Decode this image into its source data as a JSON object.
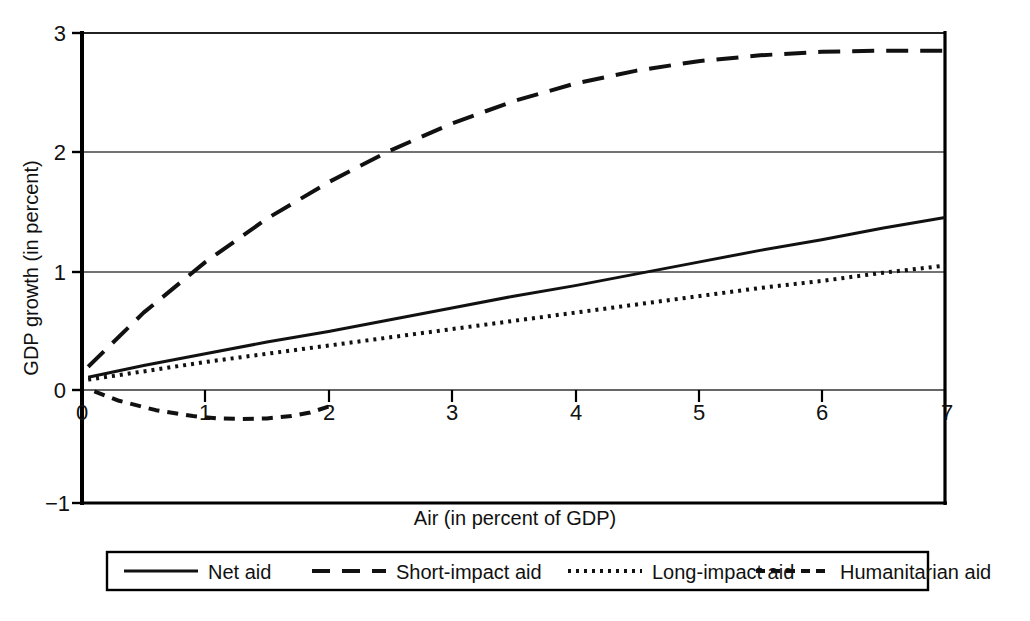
{
  "chart_data": {
    "type": "line",
    "title": "",
    "xlabel": "Air (in percent of GDP)",
    "ylabel": "GDP growth (in percent)",
    "xlim": [
      0,
      7
    ],
    "ylim": [
      -1,
      3
    ],
    "xticks": [
      "0",
      "1",
      "2",
      "3",
      "4",
      "5",
      "6",
      "7"
    ],
    "xtick_values": [
      0,
      1,
      2,
      3,
      4,
      5,
      6,
      7
    ],
    "yticks": [
      "3",
      "2",
      "1",
      "0",
      "−1"
    ],
    "ytick_values": [
      3,
      2,
      1,
      0,
      -1
    ],
    "grid": "horizontal gridlines at y = 3, 2, 1, 0",
    "legend_position": "below plot, single horizontal row in bordered box",
    "series": [
      {
        "name": "Net aid",
        "style": "solid",
        "x": [
          0.05,
          0.5,
          1,
          1.5,
          2,
          2.5,
          3,
          3.5,
          4,
          4.5,
          5,
          5.5,
          6,
          6.5,
          7
        ],
        "values": [
          0.07,
          0.17,
          0.27,
          0.37,
          0.46,
          0.56,
          0.66,
          0.76,
          0.85,
          0.95,
          1.05,
          1.15,
          1.24,
          1.34,
          1.43
        ]
      },
      {
        "name": "Short-impact aid",
        "style": "dashed",
        "x": [
          0.05,
          0.5,
          1,
          1.5,
          2,
          2.5,
          3,
          3.5,
          4,
          4.5,
          5,
          5.5,
          6,
          6.5,
          7
        ],
        "values": [
          0.16,
          0.62,
          1.05,
          1.42,
          1.73,
          2.0,
          2.23,
          2.42,
          2.57,
          2.68,
          2.76,
          2.81,
          2.84,
          2.85,
          2.85
        ]
      },
      {
        "name": "Long-impact aid",
        "style": "dotted",
        "x": [
          0.05,
          0.5,
          1,
          1.5,
          2,
          2.5,
          3,
          3.5,
          4,
          4.5,
          5,
          5.5,
          6,
          6.5,
          7
        ],
        "values": [
          0.05,
          0.12,
          0.2,
          0.27,
          0.34,
          0.41,
          0.48,
          0.55,
          0.62,
          0.69,
          0.76,
          0.83,
          0.89,
          0.96,
          1.02
        ]
      },
      {
        "name": "Humanitarian aid",
        "style": "short-dashed",
        "x": [
          0.1,
          0.3,
          0.6,
          0.9,
          1.1,
          1.3,
          1.5,
          1.7,
          1.85,
          2.0
        ],
        "values": [
          -0.05,
          -0.13,
          -0.21,
          -0.26,
          -0.28,
          -0.285,
          -0.28,
          -0.26,
          -0.23,
          -0.18
        ]
      }
    ]
  },
  "axes": {
    "y_title": "GDP growth (in percent)",
    "x_title": "Air (in percent of GDP)",
    "y_tick_labels": [
      "3",
      "2",
      "1",
      "0",
      "−1"
    ],
    "x_tick_labels": [
      "0",
      "1",
      "2",
      "3",
      "4",
      "5",
      "6",
      "7"
    ]
  },
  "legend": {
    "items": [
      {
        "label": "Net aid",
        "style": "solid"
      },
      {
        "label": "Short-impact aid",
        "style": "dashed"
      },
      {
        "label": "Long-impact aid",
        "style": "dotted"
      },
      {
        "label": "Humanitarian aid",
        "style": "short-dashed"
      }
    ]
  },
  "colors": {
    "line": "#111111",
    "grid": "#333333",
    "axis": "#000000",
    "background": "#ffffff"
  }
}
